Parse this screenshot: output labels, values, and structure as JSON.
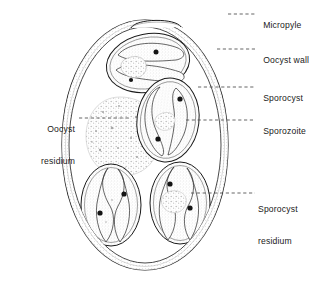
{
  "figure": {
    "subject": "oocyst",
    "colors": {
      "line": "#1a1a1a",
      "wall_fill": "#ffffff",
      "stipple": "#9a9a9a",
      "nucleus": "#111111",
      "leader": "#555555",
      "text": "#1a1a1a"
    }
  },
  "labels": [
    {
      "id": "micropyle",
      "text": "Micropyle",
      "text2": "",
      "side": "right",
      "x": 258,
      "y": 9,
      "leader": {
        "x1": 228,
        "y1": 14,
        "x2": 255,
        "y2": 14
      }
    },
    {
      "id": "oocyst-wall",
      "text": "Oocyst",
      "text2": "wall",
      "side": "right",
      "x": 258,
      "y": 44,
      "leader": {
        "x1": 217,
        "y1": 49,
        "x2": 255,
        "y2": 49
      }
    },
    {
      "id": "sporocyst",
      "text": "Sporocyst",
      "text2": "",
      "side": "right",
      "x": 258,
      "y": 82,
      "leader": {
        "x1": 198,
        "y1": 87,
        "x2": 255,
        "y2": 87
      }
    },
    {
      "id": "sporozoite",
      "text": "Sporozoite",
      "text2": "",
      "side": "right",
      "x": 258,
      "y": 115,
      "leader": {
        "x1": 186,
        "y1": 120,
        "x2": 255,
        "y2": 120
      }
    },
    {
      "id": "sporocyst-residium",
      "text": "Sporocyst",
      "text2": "residium",
      "side": "right",
      "x": 258,
      "y": 183,
      "leader": {
        "x1": 191,
        "y1": 193,
        "x2": 255,
        "y2": 193
      }
    },
    {
      "id": "oocyst-residium",
      "text": "Oocyst",
      "text2": "residium",
      "side": "left",
      "x": 10,
      "y": 103,
      "leader": {
        "x1": 79,
        "y1": 118,
        "x2": 131,
        "y2": 118
      }
    }
  ],
  "structures": {
    "oocyst_wall": {
      "name": "oocyst wall",
      "shape": "ellipse",
      "cx": 145,
      "cy": 145,
      "rx": 83,
      "ry": 125,
      "double_wall": true
    },
    "micropyle": {
      "name": "micropyle",
      "shape": "cap-arc",
      "cx": 156,
      "cy": 22,
      "width": 48
    },
    "oocyst_residium": {
      "name": "oocyst residium",
      "shape": "granular-blob",
      "cx": 122,
      "cy": 135,
      "r": 38
    },
    "sporocysts": [
      {
        "id": "sporocyst-top",
        "cx": 147,
        "cy": 63,
        "rx": 40,
        "ry": 28,
        "rot": -12,
        "sporozoites": 2,
        "nuclei": 2,
        "residium": true
      },
      {
        "id": "sporocyst-right",
        "cx": 167,
        "cy": 120,
        "rx": 30,
        "ry": 40,
        "rot": 8,
        "sporozoites": 2,
        "nuclei": 2,
        "residium": true
      },
      {
        "id": "sporocyst-bottom-left",
        "cx": 111,
        "cy": 205,
        "rx": 29,
        "ry": 40,
        "rot": 0,
        "sporozoites": 2,
        "nuclei": 2,
        "residium": false
      },
      {
        "id": "sporocyst-bottom-right",
        "cx": 180,
        "cy": 203,
        "rx": 29,
        "ry": 40,
        "rot": 0,
        "sporozoites": 2,
        "nuclei": 2,
        "residium": true
      }
    ]
  }
}
